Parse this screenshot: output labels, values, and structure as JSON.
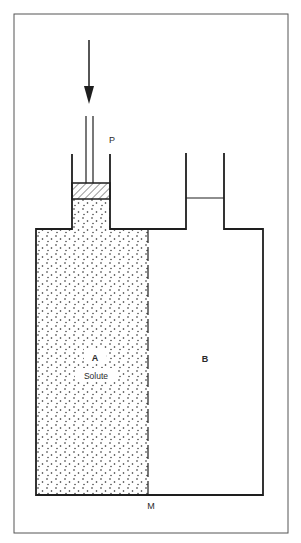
{
  "diagram": {
    "type": "osmosis apparatus",
    "labels": {
      "piston": "P",
      "compartment_a": "A",
      "compartment_a_content": "Solute",
      "compartment_b": "B",
      "membrane": "M"
    },
    "elements": [
      {
        "id": "force-arrow",
        "description": "downward arrow applying pressure on piston"
      },
      {
        "id": "piston",
        "description": "hatched piston in left tube"
      },
      {
        "id": "left-tube",
        "description": "tube above compartment A"
      },
      {
        "id": "right-tube",
        "description": "tube above compartment B with liquid level"
      },
      {
        "id": "compartment-a",
        "description": "solute-filled (stippled) chamber"
      },
      {
        "id": "compartment-b",
        "description": "pure solvent chamber"
      },
      {
        "id": "membrane",
        "description": "dashed semipermeable membrane separating A and B"
      }
    ],
    "colors": {
      "line": "#1e1e1e",
      "frame": "#555555",
      "background": "#ffffff"
    }
  }
}
